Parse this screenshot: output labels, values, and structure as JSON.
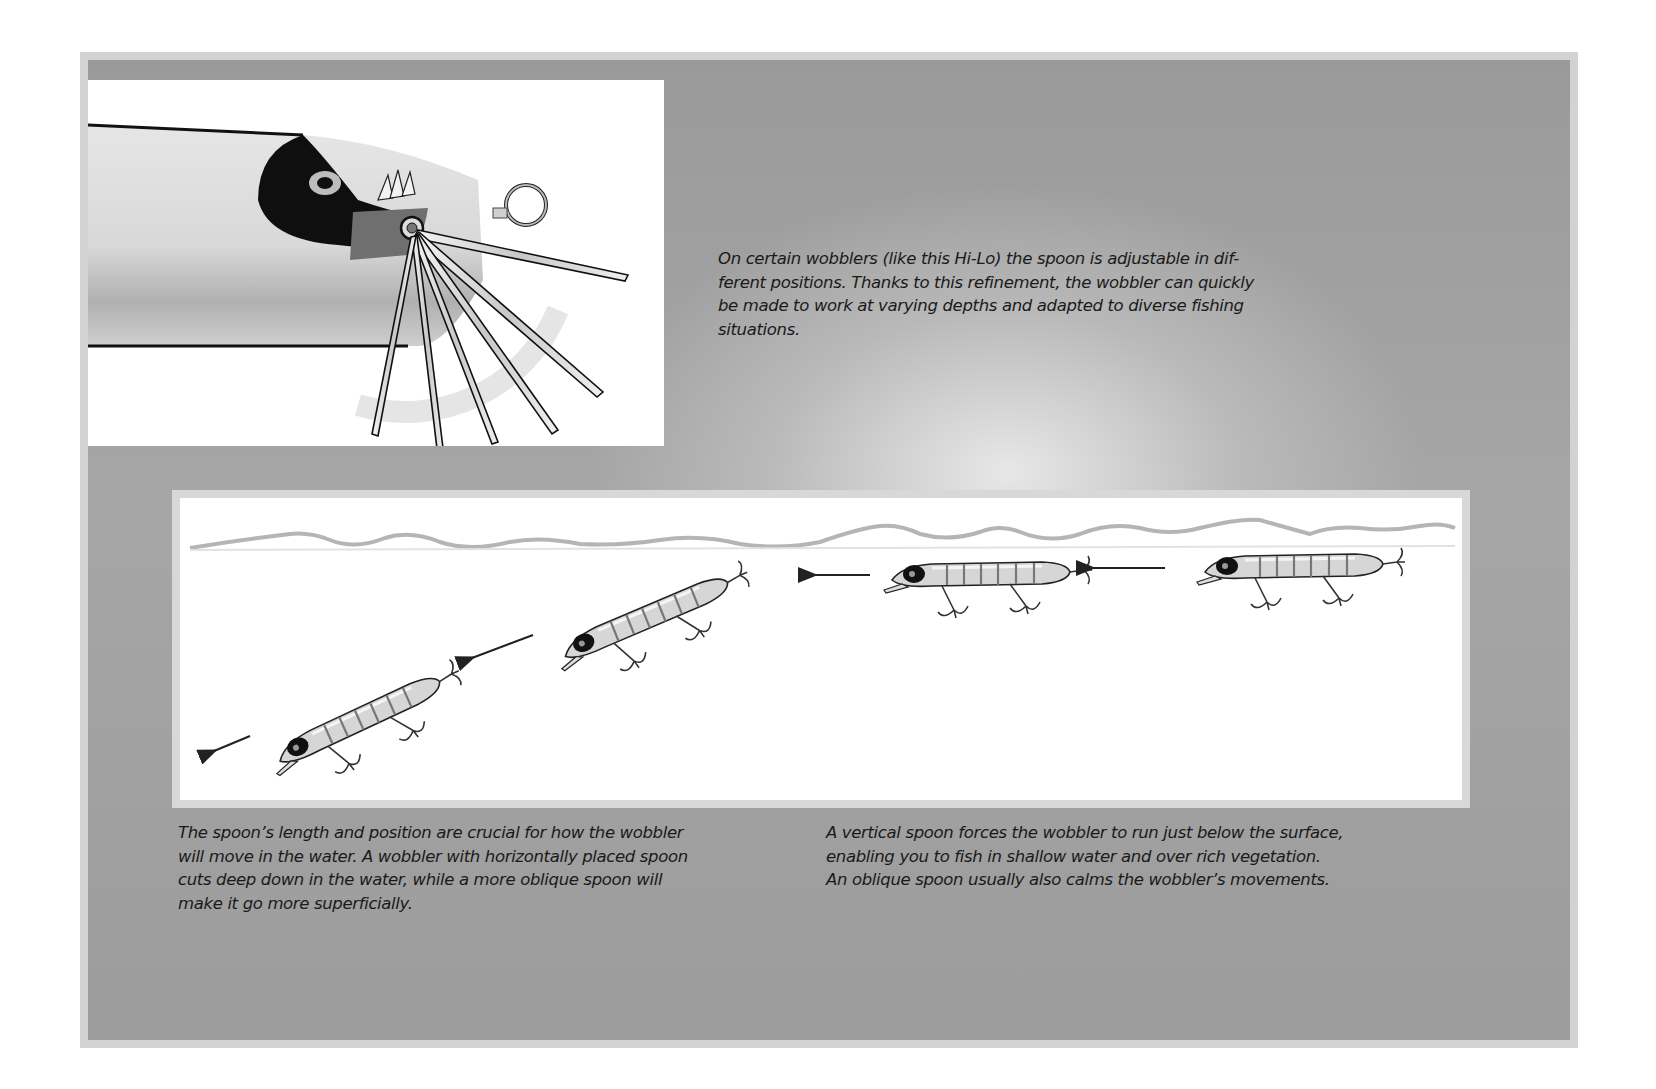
{
  "page": {
    "colors": {
      "frame_border": "#d2d2d2",
      "panel_gray": "#9c9c9c",
      "figure_bg": "#ffffff",
      "text": "#1a1a1a",
      "lure_body": "#d9d9d9",
      "lure_outline": "#222222",
      "lip_dark": "#111111"
    }
  },
  "figure_top": {
    "subject": "hi-lo-wobbler-adjustable-spoon-closeup",
    "spoon_positions": 7,
    "icons": [
      "lure-body",
      "lure-eye",
      "adjustable-spoon-fan",
      "line-eye-ring",
      "rotation-arc-arrow"
    ]
  },
  "caption_top": {
    "lines": [
      "On certain wobblers (like this Hi-Lo) the spoon is adjustable in dif-",
      "ferent positions. Thanks to this refinement, the wobbler can quickly",
      "be made to work at varying depths and adapted to diverse fishing",
      "situations."
    ]
  },
  "figure_bottom": {
    "subject": "wobbler-depth-comparison",
    "lures": [
      {
        "label": "deep-runner-lure-1",
        "position": "bottom-left"
      },
      {
        "label": "deep-runner-lure-2",
        "position": "middle-left"
      },
      {
        "label": "surface-runner-lure-1",
        "position": "middle-right"
      },
      {
        "label": "surface-runner-lure-2",
        "position": "top-right"
      }
    ],
    "arrows": 4,
    "arrow_direction": "left"
  },
  "caption_left": {
    "lines": [
      "The spoon’s length and position are crucial for how the wobbler",
      "will move in the water. A wobbler with horizontally placed spoon",
      "cuts deep down in the water, while a more oblique spoon will",
      "make it go more superficially."
    ]
  },
  "caption_right": {
    "lines": [
      "A vertical spoon forces the wobbler to run just below the surface,",
      "enabling you to fish in shallow water and over rich vegetation.",
      "An oblique spoon usually also calms the wobbler’s movements."
    ]
  }
}
